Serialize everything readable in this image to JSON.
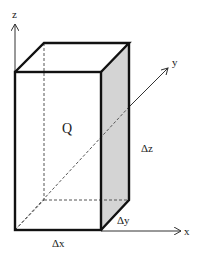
{
  "diagram": {
    "volume_label": "Q",
    "dimensions": {
      "dx": "Δx",
      "dy": "Δy",
      "dz": "Δz"
    },
    "axes": {
      "x": "x",
      "y": "y",
      "z": "z"
    },
    "colors": {
      "edge": "#111111",
      "hidden_edge": "#555555",
      "shaded_face": "#d4d4d4",
      "axis": "#333333"
    }
  }
}
